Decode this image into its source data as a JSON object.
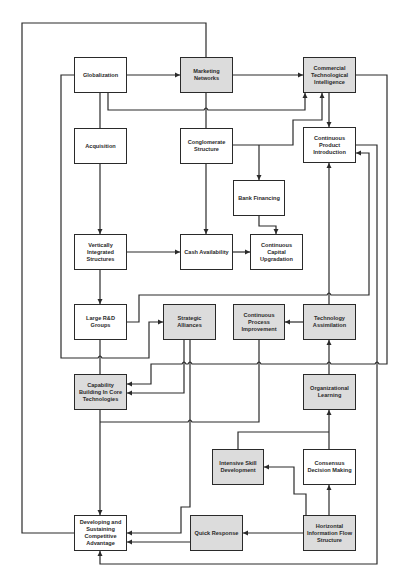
{
  "diagram": {
    "nodes": [
      {
        "id": "globalization",
        "label": "Globalization",
        "shaded": false,
        "x": 74,
        "y": 57,
        "w": 53,
        "h": 36
      },
      {
        "id": "marketing",
        "label": "Marketing Networks",
        "shaded": true,
        "x": 180,
        "y": 57,
        "w": 53,
        "h": 36
      },
      {
        "id": "cti",
        "label": "Commercial Technological Intelligence",
        "shaded": true,
        "x": 303,
        "y": 57,
        "w": 53,
        "h": 36
      },
      {
        "id": "acquisition",
        "label": "Acquisition",
        "shaded": false,
        "x": 74,
        "y": 128,
        "w": 53,
        "h": 36
      },
      {
        "id": "conglomerate",
        "label": "Conglomerate Structure",
        "shaded": false,
        "x": 180,
        "y": 128,
        "w": 53,
        "h": 36
      },
      {
        "id": "cpi_product",
        "label": "Continuous Product Introduction",
        "shaded": false,
        "x": 303,
        "y": 127,
        "w": 53,
        "h": 36
      },
      {
        "id": "bank",
        "label": "Bank Financing",
        "shaded": false,
        "x": 233,
        "y": 180,
        "w": 52,
        "h": 36
      },
      {
        "id": "vis",
        "label": "Vertically Integrated Structures",
        "shaded": false,
        "x": 74,
        "y": 234,
        "w": 53,
        "h": 36
      },
      {
        "id": "cash",
        "label": "Cash Availability",
        "shaded": false,
        "x": 180,
        "y": 234,
        "w": 53,
        "h": 36
      },
      {
        "id": "ccu",
        "label": "Continuous Capital Upgradation",
        "shaded": false,
        "x": 250,
        "y": 234,
        "w": 53,
        "h": 36
      },
      {
        "id": "rnd",
        "label": "Large R&D Groups",
        "shaded": false,
        "x": 74,
        "y": 304,
        "w": 53,
        "h": 36
      },
      {
        "id": "alliances",
        "label": "Strategic Alliances",
        "shaded": true,
        "x": 163,
        "y": 304,
        "w": 53,
        "h": 36
      },
      {
        "id": "cpi_process",
        "label": "Continuous Process Improvement",
        "shaded": true,
        "x": 233,
        "y": 304,
        "w": 52,
        "h": 36
      },
      {
        "id": "tech_assim",
        "label": "Technology Assimilation",
        "shaded": true,
        "x": 303,
        "y": 304,
        "w": 53,
        "h": 36
      },
      {
        "id": "capability",
        "label": "Capability Building In Core Technologies",
        "shaded": true,
        "x": 74,
        "y": 374,
        "w": 53,
        "h": 36
      },
      {
        "id": "org_learning",
        "label": "Organizational Learning",
        "shaded": true,
        "x": 303,
        "y": 374,
        "w": 53,
        "h": 36
      },
      {
        "id": "skill",
        "label": "Intensive Skill Development",
        "shaded": true,
        "x": 212,
        "y": 449,
        "w": 52,
        "h": 36
      },
      {
        "id": "consensus",
        "label": "Consensus Decision Making",
        "shaded": false,
        "x": 303,
        "y": 449,
        "w": 53,
        "h": 36
      },
      {
        "id": "developing",
        "label": "Developing and Sustaining Competitive Advantage",
        "shaded": false,
        "x": 74,
        "y": 515,
        "w": 53,
        "h": 36
      },
      {
        "id": "quick",
        "label": "Quick Response",
        "shaded": true,
        "x": 190,
        "y": 515,
        "w": 53,
        "h": 36
      },
      {
        "id": "horizontal",
        "label": "Horizontal Information Flow Structure",
        "shaded": true,
        "x": 303,
        "y": 515,
        "w": 53,
        "h": 36
      }
    ],
    "edges": [
      {
        "from": "globalization",
        "to": "marketing"
      },
      {
        "from": "marketing",
        "to": "cti"
      },
      {
        "from": "globalization",
        "to": "cti"
      },
      {
        "from": "conglomerate",
        "to": "cti"
      },
      {
        "from": "cti",
        "to": "cpi_product"
      },
      {
        "from": "conglomerate",
        "to": "bank"
      },
      {
        "from": "conglomerate",
        "to": "cash"
      },
      {
        "from": "acquisition",
        "to": "vis"
      },
      {
        "from": "vis",
        "to": "cash"
      },
      {
        "from": "cash",
        "to": "ccu"
      },
      {
        "from": "bank",
        "to": "ccu"
      },
      {
        "from": "vis",
        "to": "rnd"
      },
      {
        "from": "rnd",
        "to": "cpi_product"
      },
      {
        "from": "globalization",
        "to": "alliances"
      },
      {
        "from": "tech_assim",
        "to": "cpi_process"
      },
      {
        "from": "tech_assim",
        "to": "cpi_product"
      },
      {
        "from": "org_learning",
        "to": "tech_assim"
      },
      {
        "from": "alliances",
        "to": "capability"
      },
      {
        "from": "cti",
        "to": "capability"
      },
      {
        "from": "rnd",
        "to": "capability"
      },
      {
        "from": "capability",
        "to": "developing"
      },
      {
        "from": "cpi_process",
        "to": "developing"
      },
      {
        "from": "alliances",
        "to": "developing"
      },
      {
        "from": "skill",
        "to": "org_learning"
      },
      {
        "from": "consensus",
        "to": "org_learning"
      },
      {
        "from": "horizontal",
        "to": "consensus"
      },
      {
        "from": "horizontal",
        "to": "skill"
      },
      {
        "from": "horizontal",
        "to": "quick"
      },
      {
        "from": "quick",
        "to": "developing"
      },
      {
        "from": "cpi_product",
        "to": "developing"
      },
      {
        "from": "developing",
        "to": "marketing"
      }
    ],
    "colors": {
      "line": "#2a2a2a",
      "shaded_fill": "#dcdcdc",
      "plain_fill": "#ffffff"
    }
  }
}
